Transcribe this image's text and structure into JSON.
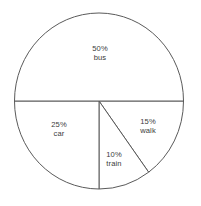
{
  "chart_data": {
    "type": "pie",
    "title": "",
    "subtitle": "",
    "xlabel": "",
    "ylabel": "",
    "legend": "none",
    "grid": false,
    "unit": "%",
    "total": 100,
    "start_angle_deg": 0,
    "direction": "clockwise",
    "categories": [
      "walk",
      "train",
      "car",
      "bus"
    ],
    "values": [
      15,
      10,
      25,
      50
    ],
    "slices": [
      {
        "name": "walk",
        "value": 15,
        "percent_label": "15%",
        "start_deg": 0,
        "end_deg": 54,
        "label_x": 148,
        "label_y": 126
      },
      {
        "name": "train",
        "value": 10,
        "percent_label": "10%",
        "start_deg": 54,
        "end_deg": 90,
        "label_x": 114,
        "label_y": 159
      },
      {
        "name": "car",
        "value": 25,
        "percent_label": "25%",
        "start_deg": 90,
        "end_deg": 180,
        "label_x": 59,
        "label_y": 129
      },
      {
        "name": "bus",
        "value": 50,
        "percent_label": "50%",
        "start_deg": 180,
        "end_deg": 360,
        "label_x": 100,
        "label_y": 53
      }
    ]
  },
  "style": {
    "background": "#ffffff",
    "stroke": "#5a5a5a",
    "slice_fill": "#ffffff",
    "text": "#3b3b3b"
  },
  "geometry": {
    "cx": 99,
    "cy": 101,
    "rx": 84.5,
    "ry": 88
  }
}
